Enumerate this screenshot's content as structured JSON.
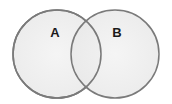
{
  "diagram": {
    "type": "venn",
    "background": "#ffffff",
    "stroke_color": "#7a7a7a",
    "fill_color": "#ececec",
    "fill_center_color": "#f3f3f3",
    "sets": [
      {
        "id": "A",
        "label": "A",
        "cx": 57,
        "cy": 54,
        "r": 44,
        "label_x": 55,
        "label_y": 37
      },
      {
        "id": "B",
        "label": "B",
        "cx": 115,
        "cy": 54,
        "r": 44,
        "label_x": 117,
        "label_y": 37
      }
    ]
  }
}
